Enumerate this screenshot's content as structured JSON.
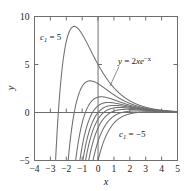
{
  "chart_data": {
    "type": "line",
    "title": "",
    "xlabel": "x",
    "ylabel": "y",
    "xlim": [
      -4,
      5
    ],
    "ylim": [
      -5,
      10
    ],
    "xticks": [
      -4,
      -3,
      -2,
      -1,
      0,
      1,
      2,
      3,
      4,
      5
    ],
    "xticklabels": [
      "−4",
      "−3",
      "−2",
      "−1",
      "0",
      "1",
      "2",
      "3",
      "4",
      "5"
    ],
    "yticks": [
      -5,
      0,
      5,
      10
    ],
    "yticklabels": [
      "−5",
      "0",
      "5",
      "10"
    ],
    "grid": false,
    "legend": "none",
    "frame": true,
    "equation": "y = 2xe^{-x} + c_1 e^{-x}",
    "particular_solution": "y = 2xe^{-x}",
    "series": [
      {
        "name": "c1 = 5",
        "c1": 5,
        "formula": "2*x*exp(-x) + 5*exp(-x)"
      },
      {
        "name": "c1 = 3",
        "c1": 3,
        "formula": "2*x*exp(-x) + 3*exp(-x)"
      },
      {
        "name": "c1 = 1.6",
        "c1": 1.6,
        "formula": "2*x*exp(-x) + 1.6*exp(-x)"
      },
      {
        "name": "c1 = 0.7",
        "c1": 0.7,
        "formula": "2*x*exp(-x) + 0.7*exp(-x)"
      },
      {
        "name": "c1 = 0",
        "c1": 0,
        "formula": "2*x*exp(-x)"
      },
      {
        "name": "c1 = -0.7",
        "c1": -0.7,
        "formula": "2*x*exp(-x) - 0.7*exp(-x)"
      },
      {
        "name": "c1 = -1.6",
        "c1": -1.6,
        "formula": "2*x*exp(-x) - 1.6*exp(-x)"
      },
      {
        "name": "c1 = -3",
        "c1": -3,
        "formula": "2*x*exp(-x) - 3*exp(-x)"
      },
      {
        "name": "c1 = -5",
        "c1": -5,
        "formula": "2*x*exp(-x) - 5*exp(-x)"
      }
    ],
    "annotations": [
      {
        "id": "c1-top",
        "text": "c₁ = 5",
        "x": -3.1,
        "y": 8.6
      },
      {
        "id": "c1-bottom",
        "text": "c₁ = −5",
        "x": 1.25,
        "y": -3.0
      },
      {
        "id": "particular",
        "text": "y = 2xe⁻ˣ",
        "x": 1.35,
        "y": 4.0
      }
    ]
  },
  "labels": {
    "x_axis": "x",
    "y_axis": "y",
    "c1_top": {
      "base": "c",
      "sub": "1",
      "rest": " = 5"
    },
    "c1_bottom": {
      "base": "c",
      "sub": "1",
      "rest": " = −5"
    },
    "particular": {
      "lhs": "y",
      "eq": " = 2",
      "var": "xe",
      "exp": "−x"
    },
    "xticks": [
      "−4",
      "−3",
      "−2",
      "−1",
      "0",
      "1",
      "2",
      "3",
      "4",
      "5"
    ],
    "yticks": [
      "10",
      "5",
      "0",
      "−5"
    ]
  },
  "colors": {
    "curve": "#6e6e6e",
    "axis": "#6e6e6e",
    "frame": "#6e6e6e",
    "text": "#1a1a1a",
    "background": "#ffffff"
  }
}
